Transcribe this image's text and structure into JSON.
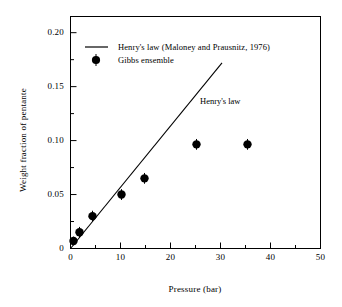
{
  "chart_data": {
    "type": "scatter",
    "title": "",
    "xlabel": "Pressure (bar)",
    "ylabel": "Weight fraction of pentante",
    "xlim": [
      0,
      50
    ],
    "ylim": [
      0,
      0.215
    ],
    "xticks": [
      "0",
      "10",
      "20",
      "30",
      "40",
      "50"
    ],
    "xtick_values": [
      0,
      10,
      20,
      30,
      40,
      50
    ],
    "x_minor_step": 5,
    "yticks": [
      "0",
      "0.05",
      "0.10",
      "0.15",
      "0.20"
    ],
    "ytick_values": [
      0,
      0.05,
      0.1,
      0.15,
      0.2
    ],
    "y_minor_step": 0.025,
    "grid": false,
    "legend_position": "top-left-inside",
    "series": [
      {
        "name": "Henry's law (Maloney and Prausnitz, 1976)",
        "type": "line",
        "color": "#000000",
        "x": [
          0,
          30.3
        ],
        "y": [
          0,
          0.172
        ]
      },
      {
        "name": "Gibbs ensemble",
        "type": "scatter",
        "color": "#000000",
        "marker": "filled-circle-with-errorbar",
        "points": [
          {
            "x": 0.6,
            "y": 0.007,
            "yerr": 0.004
          },
          {
            "x": 1.8,
            "y": 0.015,
            "yerr": 0.005
          },
          {
            "x": 4.4,
            "y": 0.03,
            "yerr": 0.005
          },
          {
            "x": 10.2,
            "y": 0.05,
            "yerr": 0.005
          },
          {
            "x": 14.8,
            "y": 0.065,
            "yerr": 0.005
          },
          {
            "x": 25.2,
            "y": 0.0965,
            "yerr": 0.005
          },
          {
            "x": 35.4,
            "y": 0.0965,
            "yerr": 0.005
          }
        ]
      }
    ],
    "annotations": [
      {
        "text": "Henry's law",
        "x": 27.5,
        "y": 0.145
      }
    ]
  },
  "legend": {
    "items": [
      {
        "label": "Henry's law (Maloney and Prausnitz, 1976)",
        "marker": "line"
      },
      {
        "label": "Gibbs ensemble",
        "marker": "circle"
      }
    ]
  },
  "axes": {
    "x_title": "Pressure (bar)",
    "y_title": "Weight fraction of pentante"
  }
}
